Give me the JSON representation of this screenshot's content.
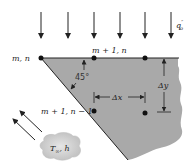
{
  "diagram": {
    "heat_flux_label": "q″o",
    "heat_flux_main": "q",
    "heat_flux_sup": "″",
    "heat_flux_sub": "o",
    "nodes": [
      {
        "id": "m_n",
        "label": "m, n"
      },
      {
        "id": "m1_n",
        "label": "m + 1, n"
      },
      {
        "id": "m2_n",
        "label": ""
      },
      {
        "id": "m1_n1",
        "label": "m + 1, n − 1"
      },
      {
        "id": "m2_n1",
        "label": ""
      }
    ],
    "angle_label": "45°",
    "dx_label": "Δx",
    "dy_label": "Δy",
    "convection_label": "T∞, h",
    "convection_T": "T",
    "convection_sub": "∞",
    "convection_h": ", h",
    "colors": {
      "solid_fill": "#a9a9a9",
      "cloud_fill": "#cfcfcf",
      "line": "#222222"
    }
  }
}
